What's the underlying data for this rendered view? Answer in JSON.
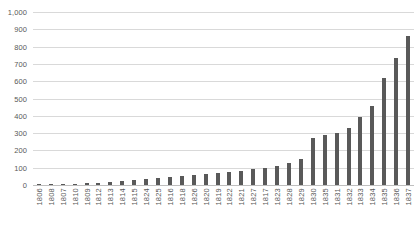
{
  "chart_data": {
    "type": "bar",
    "title": "",
    "subtitle": "",
    "xlabel": "",
    "ylabel": "",
    "grid": true,
    "legend": false,
    "legend_position": "none",
    "ylim": [
      0,
      1000
    ],
    "ytick_labels": [
      "1,000",
      "900",
      "800",
      "700",
      "600",
      "500",
      "400",
      "300",
      "200",
      "100",
      "0"
    ],
    "ytick_values": [
      1000,
      900,
      800,
      700,
      600,
      500,
      400,
      300,
      200,
      100,
      0
    ],
    "categories": [
      "1806",
      "1808",
      "1807",
      "1810",
      "1809",
      "1812",
      "1813",
      "1814",
      "1815",
      "1824",
      "1825",
      "1816",
      "1818",
      "1826",
      "1820",
      "1819",
      "1822",
      "1821",
      "1827",
      "1817",
      "1823",
      "1828",
      "1829",
      "1830",
      "1835",
      "1831",
      "1832",
      "1833",
      "1834",
      "1835",
      "1836",
      "1837"
    ],
    "values": [
      4,
      5,
      6,
      8,
      10,
      14,
      18,
      22,
      28,
      34,
      40,
      46,
      52,
      58,
      64,
      70,
      76,
      82,
      90,
      100,
      112,
      130,
      148,
      270,
      290,
      300,
      330,
      395,
      455,
      620,
      735,
      860
    ],
    "bar_color": "#595959",
    "grid_color": "#d9d9d9",
    "axis_color": "#bfbfbf",
    "background_color": "#ffffff"
  }
}
